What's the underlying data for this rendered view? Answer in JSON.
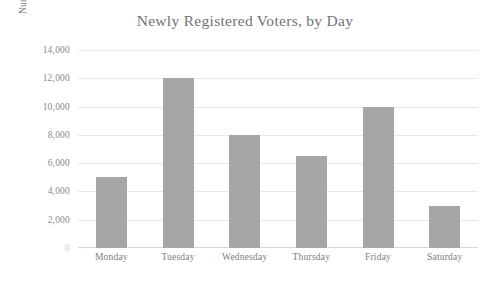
{
  "chart_data": {
    "type": "bar",
    "title": "Newly Registered Voters, by Day",
    "xlabel": "",
    "ylabel": "Number of voters",
    "categories": [
      "Monday",
      "Tuesday",
      "Wednesday",
      "Thursday",
      "Friday",
      "Saturday"
    ],
    "values": [
      5000,
      12000,
      8000,
      6500,
      10000,
      3000
    ],
    "ylim": [
      0,
      14000
    ],
    "ytick_labels": [
      "14,000",
      "12,000",
      "10,000",
      "8,000",
      "6,000",
      "4,000",
      "2,000",
      "0"
    ],
    "ytick_values": [
      14000,
      12000,
      10000,
      8000,
      6000,
      4000,
      2000,
      0
    ],
    "grid": true,
    "legend": false,
    "colors": {
      "bar": "#a6a6a6",
      "gridline": "#e8e8e8",
      "title_text": "#727272",
      "tick_text": "#8a8a8a",
      "background": "#ffffff"
    }
  }
}
